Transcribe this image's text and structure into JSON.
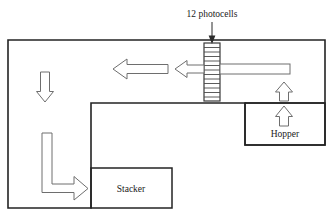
{
  "diagram": {
    "title": "12 photocells",
    "annotations": {
      "photocells_label": "12 photocells",
      "photocell_count": 12
    },
    "rooms": [
      {
        "key": "hopper",
        "label": "Hopper"
      },
      {
        "key": "stacker",
        "label": "Stacker"
      }
    ],
    "colors": {
      "wall": "#232323",
      "arrow_stroke": "#6e6e6e",
      "arrow_fill": "#ffffff",
      "text": "#1a1a1a",
      "background": "#ffffff",
      "ladder_stroke": "#3a3a3a"
    },
    "flow_arrows": [
      {
        "key": "feed-right-to-ladder",
        "direction": "left",
        "style": "shaft"
      },
      {
        "key": "ladder-output-short",
        "direction": "left",
        "style": "arrow"
      },
      {
        "key": "main-transfer-left",
        "direction": "left",
        "style": "arrow"
      },
      {
        "key": "hopper-lift-lower",
        "direction": "up",
        "style": "arrow"
      },
      {
        "key": "hopper-lift-upper",
        "direction": "up",
        "style": "arrow"
      },
      {
        "key": "left-descend",
        "direction": "down",
        "style": "arrow"
      },
      {
        "key": "stacker-feed",
        "direction": "right",
        "style": "elbow-arrow"
      }
    ]
  }
}
